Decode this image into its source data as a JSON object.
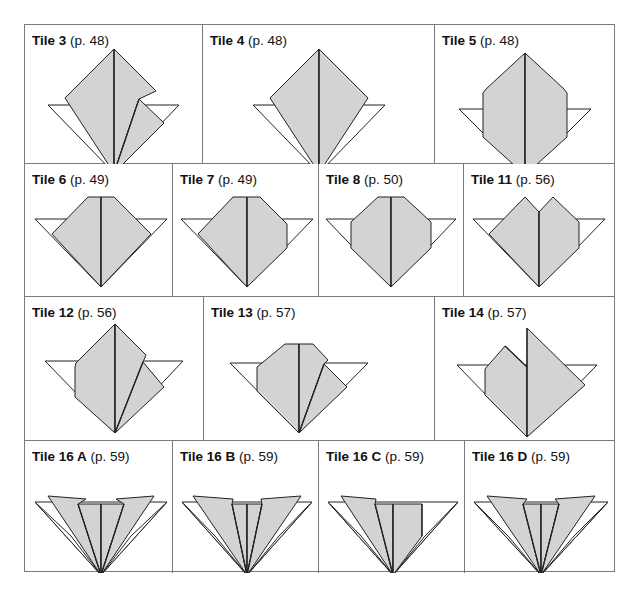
{
  "colors": {
    "fill": "#d3d3d3",
    "paper_white": "#ffffff",
    "stroke": "#222222",
    "border": "#7a7a7a"
  },
  "rows": [
    {
      "top": 0,
      "height": 139,
      "cells": [
        {
          "left": 0,
          "width": 178,
          "name": "Tile 3",
          "page": "(p. 48)",
          "cx": 89,
          "polys": [
            {
              "pts": "23,62 154,62 89,130",
              "fill": "white"
            },
            {
              "pts": "89,6 40,55 89,106",
              "fill": "gray",
              "note": "left half"
            },
            {
              "pts": "89,6 89,130 40,55",
              "fill": "gray"
            },
            {
              "pts": "89,6 131,48 114,56 89,130",
              "fill": "gray"
            },
            {
              "pts": "114,56 139,80 89,130",
              "fill": "gray"
            }
          ],
          "lines": [
            "89,6 89,130",
            "114,56 89,130",
            "40,55 89,106"
          ]
        },
        {
          "left": 178,
          "width": 232,
          "name": "Tile 4",
          "page": "(p. 48)",
          "cx": 116
        },
        {
          "left": 410,
          "width": 181,
          "name": "Tile 5",
          "page": "(p. 48)",
          "cx": 90
        }
      ]
    },
    {
      "top": 139,
      "height": 133,
      "cells": [
        {
          "left": 0,
          "width": 148,
          "name": "Tile 6",
          "page": "(p. 49)"
        },
        {
          "left": 148,
          "width": 146,
          "name": "Tile 7",
          "page": "(p. 49)"
        },
        {
          "left": 294,
          "width": 145,
          "name": "Tile 8",
          "page": "(p. 50)"
        },
        {
          "left": 439,
          "width": 152,
          "name": "Tile 11",
          "page": "(p. 56)"
        }
      ]
    },
    {
      "top": 272,
      "height": 144,
      "cells": [
        {
          "left": 0,
          "width": 179,
          "name": "Tile 12",
          "page": "(p. 56)"
        },
        {
          "left": 179,
          "width": 231,
          "name": "Tile 13",
          "page": "(p. 57)"
        },
        {
          "left": 410,
          "width": 181,
          "name": "Tile 14",
          "page": "(p. 57)"
        }
      ]
    },
    {
      "top": 416,
      "height": 132,
      "cells": [
        {
          "left": 0,
          "width": 148,
          "name": "Tile 16 A",
          "page": "(p. 59)"
        },
        {
          "left": 148,
          "width": 146,
          "name": "Tile 16 B",
          "page": "(p. 59)"
        },
        {
          "left": 294,
          "width": 146,
          "name": "Tile 16 C",
          "page": "(p. 59)"
        },
        {
          "left": 440,
          "width": 151,
          "name": "Tile 16 D",
          "page": "(p. 59)"
        }
      ]
    }
  ],
  "tiles": {
    "Tile 3": {
      "white": "23,62 154,62 89,130",
      "gray": [
        "89,6 89,130 40,55",
        "89,6 131,48 114,56 89,130",
        "114,56 139,80 89,130"
      ],
      "lines": [
        "89,6 89,130",
        "114,56 89,130"
      ]
    },
    "Tile 4": {
      "white": "50,62 182,62 116,130",
      "gray": [
        "116,6 67,55 116,130",
        "116,6 165,55 116,130"
      ],
      "lines": [
        "116,6 116,130"
      ]
    },
    "Tile 5": {
      "white": "24,66 156,66 90,132",
      "gray": [
        "90,10 51,46 48,50 48,94 90,132",
        "90,10 129,46 132,50 132,94 90,132"
      ],
      "lines": [
        "90,10 90,132"
      ]
    },
    "Tile 6": {
      "white": "10,37 142,37 76,105",
      "gray": [
        "63,15 76,15 76,105 27,52",
        "76,15 89,15 126,52 76,105"
      ],
      "lines": [
        "76,15 76,105"
      ]
    },
    "Tile 7": {
      "white": "8,37 140,37 74,105",
      "gray": [
        "60,15 74,15 74,105 25,52",
        "74,15 87,15 112,40 114,42 114,66 74,105"
      ],
      "lines": [
        "74,15 74,105"
      ]
    },
    "Tile 8": {
      "white": "7,37 137,37 72,105",
      "gray": [
        "59,15 72,15 72,105 32,66 32,40",
        "72,15 85,15 112,40 112,66 72,105"
      ],
      "lines": [
        "72,15 72,105"
      ]
    },
    "Tile 11": {
      "white": "9,37 141,37 75,105",
      "gray": [
        "61,15 75,30 75,105 25,52",
        "75,30 89,15 115,40 115,66 75,105"
      ],
      "lines": [
        "75,30 75,105"
      ]
    },
    "Tile 12": {
      "white": "20,46 158,46 90,118",
      "gray": [
        "90,9 51,48 50,52 50,82 90,118",
        "90,9 121,40 118,47 90,118",
        "118,47 139,72 90,118"
      ],
      "lines": [
        "90,9 90,118",
        "118,47 90,118"
      ]
    },
    "Tile 13": {
      "white": "26,48 164,48 95,118",
      "gray": [
        "81,29 95,29 95,118 53,76 53,52",
        "95,29 109,29 124,45 120,49 95,118",
        "120,49 143,72 95,118"
      ],
      "lines": [
        "95,29 95,118",
        "120,49 95,118"
      ]
    },
    "Tile 14": {
      "white": "22,50 162,50 92,122",
      "gray": [
        "70,31 92,52 92,122 50,80 50,54",
        "92,13 150,70 92,122"
      ],
      "lines": [
        "92,13 92,122",
        "70,31 92,52"
      ]
    },
    "Tile 16 A": {
      "white": "10,43 142,43 76,116",
      "whiteStrip": [
        "10,43 76,116 46,77",
        "142,43 76,116 106,77"
      ],
      "gray": [
        "23,37 61,40 53,45 76,116",
        "53,45 76,45 76,116",
        "76,45 99,45 76,116",
        "99,45 91,40 129,37 76,116"
      ],
      "lines": [
        "53,45 76,116",
        "99,45 76,116",
        "76,45 76,116"
      ]
    },
    "Tile 16 B": {
      "white": "9,43 139,43 74,116",
      "whiteStrip": [
        "9,43 74,116 42,77",
        "139,43 74,116 106,77"
      ],
      "gray": [
        "20,37 60,40 59,45 74,116",
        "59,45 74,45 74,116",
        "74,45 89,45 74,116",
        "89,45 88,40 128,37 74,116"
      ],
      "lines": [
        "59,45 74,116",
        "89,45 74,116",
        "74,45 74,116"
      ]
    },
    "Tile 16 C": {
      "white": "9,43 139,43 74,116",
      "whiteStrip": [
        "9,43 74,116 42,77",
        "139,43 74,116 106,77"
      ],
      "gray": [
        "22,37 57,40 56,45 74,116",
        "56,45 74,45 74,116",
        "74,45 103,45 103,77 74,116"
      ],
      "lines": [
        "56,45 74,116",
        "74,45 74,116",
        "103,45 103,77"
      ]
    },
    "Tile 16 D": {
      "white": "9,43 143,43 76,116",
      "whiteStrip": [
        "9,43 76,116 43,77",
        "143,43 76,116 109,77"
      ],
      "gray": [
        "22,37 62,40 58,45 76,116",
        "58,45 76,45 76,116",
        "76,45 94,45 76,116",
        "94,45 90,40 130,37 76,116"
      ],
      "lines": [
        "58,45 76,116",
        "94,45 76,116",
        "76,45 76,116"
      ]
    }
  }
}
